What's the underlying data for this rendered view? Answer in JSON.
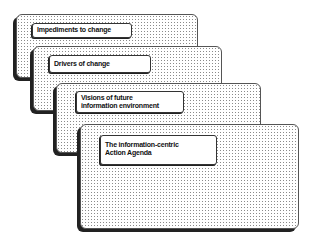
{
  "diagram": {
    "type": "stacked-cards",
    "cards": [
      {
        "id": "impediments",
        "lines": [
          "Impediments to change"
        ]
      },
      {
        "id": "drivers",
        "lines": [
          "Drivers of change"
        ]
      },
      {
        "id": "vision",
        "lines": [
          "Visions of future",
          "information environment"
        ]
      },
      {
        "id": "agenda",
        "lines": [
          "The information-centric",
          "Action Agenda"
        ]
      }
    ],
    "colors": {
      "card_border": "#555555",
      "card_shadow": "#222222",
      "dot_fill": "#8a8a8a",
      "label_bg": "#ffffff",
      "text": "#111111"
    }
  }
}
